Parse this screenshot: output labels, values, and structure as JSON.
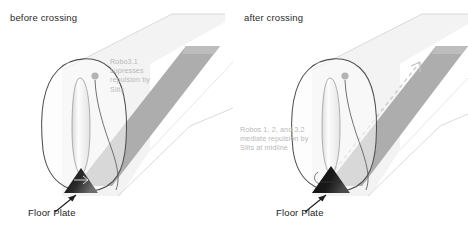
{
  "figure": {
    "type": "biology-schematic",
    "background_color": "#ffffff"
  },
  "colors": {
    "tube_fill": "#f2f2f2",
    "tube_stroke": "#d8d8d8",
    "band_fill": "#a8a8a8",
    "band_fill_light": "#c8c8c8",
    "outline_stroke": "#4a4a4a",
    "axon_fill": "#fbfbfb",
    "axon_stroke": "#9a9a9a",
    "soma_fill": "#b5b5b5",
    "floor_plate_dark": "#111111",
    "floor_plate_mid": "#3c3c3c",
    "annotation_text": "#b9b9b9",
    "label_text": "#1d1d1d",
    "dashed_line": "#cfcfcf",
    "arrow_stroke": "#1d1d1d"
  },
  "panels": [
    {
      "id": "before-crossing",
      "title": "before crossing",
      "annotation": "Robo3.1\nsupresses\nrepulsion by\nSlits",
      "floor_plate_label": "Floor Plate",
      "has_dashed_trajectory": false,
      "axon_state": "approaching midline",
      "floor_plate_shade": "gradient-dark"
    },
    {
      "id": "after-crossing",
      "title": "after crossing",
      "annotation": "Robos 1, 2, and 3.2\nmediate repulsion by\nSlits at midline",
      "floor_plate_label": "Floor Plate",
      "has_dashed_trajectory": true,
      "axon_state": "crossed midline, projecting longitudinally",
      "floor_plate_shade": "solid-dark"
    }
  ],
  "elements": {
    "neural_tube": "neural-tube-body",
    "midline_band": "floor-plate-band",
    "commissural_neuron": "commissural-neuron",
    "growth_cone": "growth-cone",
    "soma": "neuron-cell-body",
    "floor_plate_triangle": "floor-plate-triangle",
    "pointer_arrow": "floor-plate-pointer-arrow",
    "dashed_path": "post-crossing-trajectory"
  }
}
